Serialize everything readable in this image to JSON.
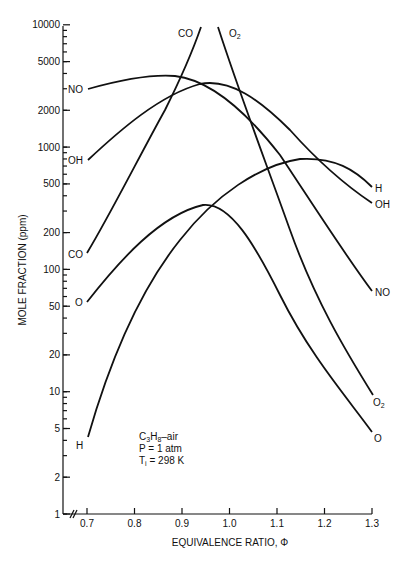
{
  "chart_data": {
    "type": "line",
    "title": "",
    "xlabel": "EQUIVALENCE RATIO, Φ",
    "ylabel": "MOLE FRACTION (ppm)",
    "yscale": "log",
    "xlim": [
      0.7,
      1.3
    ],
    "ylim": [
      1,
      10000
    ],
    "grid": false,
    "legend": "inline curve labels",
    "x_ticks": [
      "0.7",
      "0.8",
      "0.9",
      "1.0",
      "1.1",
      "1.2",
      "1.3"
    ],
    "y_ticks": [
      "1",
      "2",
      "5",
      "10",
      "20",
      "50",
      "100",
      "200",
      "500",
      "1000",
      "2000",
      "5000",
      "10000"
    ],
    "annotation": {
      "line1": "C₃H₈–air",
      "line2": "P = 1 atm",
      "line3": "Tᵢ = 298 K"
    },
    "x": [
      0.7,
      0.75,
      0.8,
      0.85,
      0.9,
      0.95,
      1.0,
      1.05,
      1.1,
      1.15,
      1.2,
      1.25,
      1.3
    ],
    "series": [
      {
        "name": "CO",
        "label_pos": "left",
        "values": [
          136,
          260,
          520,
          1100,
          2400,
          5200,
          10000,
          null,
          null,
          null,
          null,
          null,
          null
        ]
      },
      {
        "name": "O2",
        "label_pos": "top",
        "values": [
          null,
          null,
          null,
          null,
          null,
          null,
          10000,
          3200,
          900,
          250,
          75,
          25,
          10.6
        ]
      },
      {
        "name": "NO",
        "label_pos": "both",
        "values": [
          2990,
          3300,
          3600,
          3800,
          3750,
          3300,
          2500,
          1400,
          700,
          340,
          170,
          100,
          66
        ]
      },
      {
        "name": "OH",
        "label_pos": "both",
        "values": [
          785,
          1200,
          1800,
          2500,
          3100,
          3350,
          3200,
          2600,
          1800,
          1100,
          700,
          480,
          350
        ]
      },
      {
        "name": "H",
        "label_pos": "both",
        "values": [
          4.3,
          14,
          45,
          110,
          230,
          400,
          580,
          720,
          790,
          800,
          730,
          600,
          470
        ]
      },
      {
        "name": "O",
        "label_pos": "both",
        "values": [
          54,
          105,
          170,
          240,
          300,
          335,
          290,
          170,
          80,
          35,
          16,
          8.5,
          4.7
        ]
      }
    ]
  },
  "labels": {
    "y_axis_title": "MOLE FRACTION (ppm)",
    "x_axis_title": "EQUIVALENCE RATIO, Φ",
    "curve_CO_left": "CO",
    "curve_CO_top": "CO",
    "curve_O2_top": "O",
    "curve_O2_right": "O",
    "sub2": "2",
    "curve_NO_left": "NO",
    "curve_NO_right": "NO",
    "curve_OH_left": "OH",
    "curve_OH_right": "OH",
    "curve_H_left": "H",
    "curve_H_right": "H",
    "curve_O_left": "O",
    "curve_O_right": "O",
    "annot_c": "C",
    "annot_3": "3",
    "annot_h": "H",
    "annot_8": "8",
    "annot_air": "–air",
    "annot_p": "P = 1 atm",
    "annot_t": "T",
    "annot_i": "i",
    "annot_temp": " = 298 K"
  }
}
